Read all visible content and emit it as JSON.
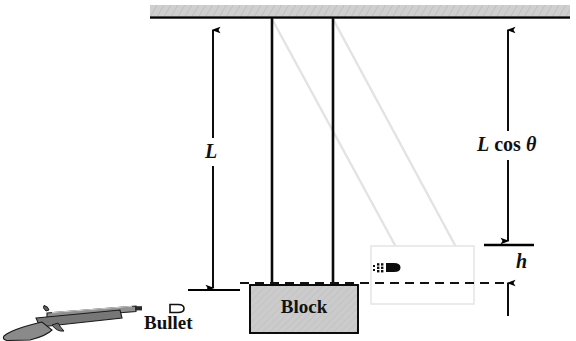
{
  "figure": {
    "type": "physics-diagram",
    "labels": {
      "length": "L",
      "l_cos_theta_L": "L",
      "l_cos_theta_cos": "cos",
      "l_cos_theta_theta": "θ",
      "height": "h",
      "block": "Block",
      "bullet": "Bullet"
    },
    "icons": {
      "rifle": "rifle-icon",
      "bullet_resting": "bullet-icon",
      "bullet_in_flight": "bullet-in-flight-icon",
      "ceiling": "ceiling-hatch",
      "pendulum_string": "string-line",
      "pendulum_string_swung": "string-line-ghost",
      "block": "block-shape",
      "block_swung": "block-ghost-shape",
      "trajectory": "dashed-trajectory-line",
      "dimension_L": "dimension-arrow-L",
      "dimension_Lcos": "dimension-arrow-Lcos",
      "dimension_h": "dimension-arrow-h"
    },
    "colors": {
      "ceiling_fill": "#c9c9c9",
      "block_fill": "#c9c9c9",
      "ghost_stroke": "#e2e2e2",
      "string": "#000000",
      "rifle_body": "#7a7a7a",
      "rifle_stock": "#8d8d8d",
      "outline": "#000000",
      "background": "#ffffff"
    },
    "geometry": {
      "ceiling": {
        "x": 150,
        "y": 5,
        "width": 420,
        "height": 13
      },
      "string_left_x": 272,
      "string_right_x": 333,
      "string_top_y": 18,
      "string_bottom_y": 287,
      "block": {
        "x": 250,
        "y": 285,
        "width": 108,
        "height": 48
      },
      "block_ghost": {
        "x": 371,
        "y": 246,
        "width": 103,
        "height": 58
      },
      "dim_L_x": 213,
      "dim_L_top": 28,
      "dim_L_bottom": 290,
      "dim_right_x": 508,
      "dim_Lcos_top": 28,
      "dim_Lcos_bottom": 243,
      "dim_h_top": 246,
      "dim_h_bottom": 283,
      "trajectory_y": 283,
      "trajectory_x1": 240,
      "trajectory_x2": 508
    }
  }
}
